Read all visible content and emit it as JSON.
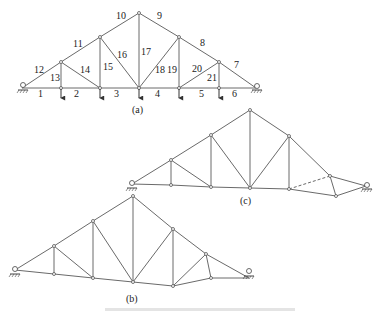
{
  "figure": {
    "panels": [
      {
        "id": "a",
        "caption": "(a)",
        "member_labels": [
          "1",
          "2",
          "3",
          "4",
          "5",
          "6",
          "7",
          "8",
          "9",
          "10",
          "11",
          "12",
          "13",
          "14",
          "15",
          "16",
          "17",
          "18",
          "19",
          "20",
          "21"
        ],
        "loads": "downward point loads at bottom chord nodes 1-5",
        "supports": [
          "pin-left",
          "roller-right"
        ]
      },
      {
        "id": "c",
        "caption": "(c)",
        "note": "deformed/modified truss with one dashed member"
      },
      {
        "id": "b",
        "caption": "(b)",
        "note": "truss with non-horizontal bottom chord"
      }
    ],
    "labels": {
      "m1": "1",
      "m2": "2",
      "m3": "3",
      "m4": "4",
      "m5": "5",
      "m6": "6",
      "m7": "7",
      "m8": "8",
      "m9": "9",
      "m10": "10",
      "m11": "11",
      "m12": "12",
      "m13": "13",
      "m14": "14",
      "m15": "15",
      "m16": "16",
      "m17": "17",
      "m18": "18",
      "m19": "19",
      "m20": "20",
      "m21": "21"
    },
    "captions": {
      "a": "(a)",
      "b": "(b)",
      "c": "(c)"
    },
    "colors": {
      "member": "#6a6a6a",
      "text": "#222222",
      "background": "#ffffff"
    }
  }
}
